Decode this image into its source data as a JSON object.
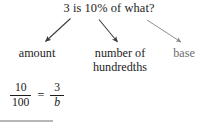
{
  "figure": {
    "name": "percent-proportion-diagram",
    "background_color": "#ffffff",
    "ink_color": "#1c1c1c",
    "muted_color": "#6d6d6d",
    "rule_color": "#b7b7b7"
  },
  "question": {
    "text": "3 is 10% of what?",
    "number_amount": "3",
    "percent": "10%",
    "unknown_word": "what?"
  },
  "terms": [
    {
      "id": "amount",
      "label": "amount",
      "color": "#1c1c1c"
    },
    {
      "id": "hundredths",
      "label_line1": "number of",
      "label_line2": "hundredths",
      "color": "#1c1c1c"
    },
    {
      "id": "base",
      "label": "base",
      "color": "#6d6d6d"
    }
  ],
  "arrows": [
    {
      "id": "arrow-to-amount",
      "from_term": "3",
      "to_term": "amount",
      "direction": "down-left",
      "color": "#3a3a3a"
    },
    {
      "id": "arrow-to-hundredths",
      "from_term": "10%",
      "to_term": "number of hundredths",
      "direction": "down-right",
      "color": "#3a3a3a"
    },
    {
      "id": "arrow-to-base",
      "from_term": "what?",
      "to_term": "base",
      "direction": "down-right",
      "color": "#8a8a8a"
    }
  ],
  "equation": {
    "expression": "10/100 = 3/b",
    "left_fraction": {
      "numerator": "10",
      "denominator": "100"
    },
    "operator": "=",
    "right_fraction": {
      "numerator": "3",
      "denominator": "b"
    }
  }
}
